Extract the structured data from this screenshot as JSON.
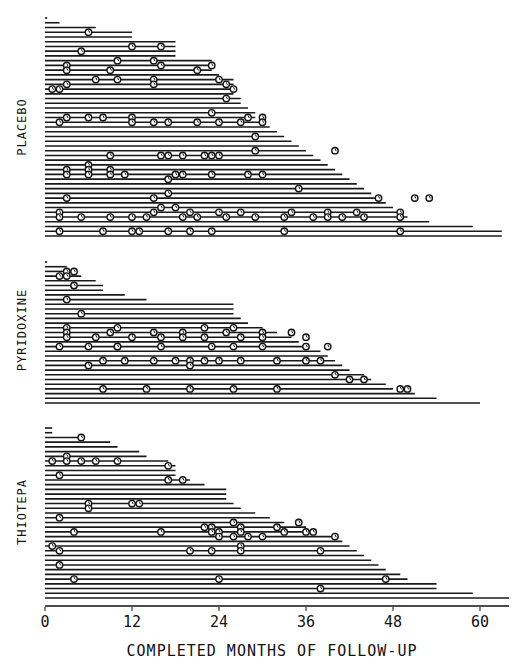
{
  "chart_data": {
    "type": "line",
    "subtype": "patient follow-up timeline (swimmer plot) with recurrence markers",
    "title": "",
    "xlabel": "COMPLETED MONTHS OF FOLLOW-UP",
    "ylabel": "",
    "xlim": [
      0,
      64
    ],
    "x_ticks": [
      0,
      12,
      24,
      36,
      48,
      60
    ],
    "x_tick_labels": [
      "0",
      "12",
      "24",
      "36",
      "48",
      "60"
    ],
    "grid": false,
    "legend": null,
    "marker_meaning": "circled symbol = tumour recurrence at that month",
    "groups": [
      {
        "name": "PLACEBO",
        "patients": [
          {
            "followup": 0.3,
            "recurrences": []
          },
          {
            "followup": 2,
            "recurrences": []
          },
          {
            "followup": 7,
            "recurrences": []
          },
          {
            "followup": 12,
            "recurrences": [
              6
            ]
          },
          {
            "followup": 12,
            "recurrences": []
          },
          {
            "followup": 18,
            "recurrences": []
          },
          {
            "followup": 18,
            "recurrences": [
              12,
              16
            ]
          },
          {
            "followup": 18,
            "recurrences": [
              5
            ]
          },
          {
            "followup": 18,
            "recurrences": []
          },
          {
            "followup": 23,
            "recurrences": [
              10,
              15
            ]
          },
          {
            "followup": 23,
            "recurrences": [
              3,
              16,
              23
            ]
          },
          {
            "followup": 23,
            "recurrences": [
              3,
              9,
              21
            ]
          },
          {
            "followup": 24,
            "recurrences": []
          },
          {
            "followup": 26,
            "recurrences": [
              7,
              10,
              15,
              24
            ]
          },
          {
            "followup": 26,
            "recurrences": [
              3,
              15,
              25
            ]
          },
          {
            "followup": 26,
            "recurrences": [
              1,
              2,
              26
            ]
          },
          {
            "followup": 26,
            "recurrences": []
          },
          {
            "followup": 27,
            "recurrences": [
              25
            ]
          },
          {
            "followup": 27,
            "recurrences": []
          },
          {
            "followup": 28,
            "recurrences": []
          },
          {
            "followup": 29,
            "recurrences": [
              23
            ]
          },
          {
            "followup": 29,
            "recurrences": [
              3,
              6,
              8,
              12,
              28,
              30
            ]
          },
          {
            "followup": 30,
            "recurrences": [
              2,
              12,
              15,
              17,
              21,
              24,
              27,
              30
            ]
          },
          {
            "followup": 31,
            "recurrences": []
          },
          {
            "followup": 32,
            "recurrences": []
          },
          {
            "followup": 33,
            "recurrences": [
              29
            ]
          },
          {
            "followup": 34,
            "recurrences": []
          },
          {
            "followup": 35,
            "recurrences": []
          },
          {
            "followup": 36,
            "recurrences": [
              29,
              40
            ]
          },
          {
            "followup": 37,
            "recurrences": [
              9,
              16,
              17,
              19,
              22,
              23,
              24
            ]
          },
          {
            "followup": 38,
            "recurrences": []
          },
          {
            "followup": 39,
            "recurrences": [
              6
            ]
          },
          {
            "followup": 40,
            "recurrences": [
              3,
              6,
              9
            ]
          },
          {
            "followup": 41,
            "recurrences": [
              3,
              6,
              9,
              11,
              18,
              19,
              23,
              28,
              30
            ]
          },
          {
            "followup": 42,
            "recurrences": [
              17
            ]
          },
          {
            "followup": 43,
            "recurrences": []
          },
          {
            "followup": 44,
            "recurrences": [
              35
            ]
          },
          {
            "followup": 45,
            "recurrences": [
              17
            ]
          },
          {
            "followup": 46,
            "recurrences": [
              3,
              15,
              46,
              51,
              53
            ]
          },
          {
            "followup": 47,
            "recurrences": []
          },
          {
            "followup": 48,
            "recurrences": [
              16,
              18
            ]
          },
          {
            "followup": 49,
            "recurrences": [
              2,
              15,
              20,
              24,
              27,
              34,
              39,
              43,
              49
            ]
          },
          {
            "followup": 50,
            "recurrences": [
              2,
              5,
              9,
              12,
              14,
              19,
              21,
              25,
              29,
              33,
              37,
              39,
              41,
              44,
              49
            ]
          },
          {
            "followup": 53,
            "recurrences": []
          },
          {
            "followup": 59,
            "recurrences": []
          },
          {
            "followup": 63,
            "recurrences": [
              2,
              8,
              12,
              13,
              17,
              20,
              23,
              33,
              49
            ]
          },
          {
            "followup": 63,
            "recurrences": []
          }
        ]
      },
      {
        "name": "PYRIDOXINE",
        "patients": [
          {
            "followup": 0.3,
            "recurrences": []
          },
          {
            "followup": 3,
            "recurrences": []
          },
          {
            "followup": 4,
            "recurrences": [
              3,
              4
            ]
          },
          {
            "followup": 5,
            "recurrences": [
              2,
              3
            ]
          },
          {
            "followup": 7,
            "recurrences": []
          },
          {
            "followup": 8,
            "recurrences": [
              4
            ]
          },
          {
            "followup": 8,
            "recurrences": []
          },
          {
            "followup": 11,
            "recurrences": []
          },
          {
            "followup": 14,
            "recurrences": [
              3
            ]
          },
          {
            "followup": 26,
            "recurrences": []
          },
          {
            "followup": 26,
            "recurrences": []
          },
          {
            "followup": 26,
            "recurrences": [
              5
            ]
          },
          {
            "followup": 27,
            "recurrences": []
          },
          {
            "followup": 28,
            "recurrences": []
          },
          {
            "followup": 30,
            "recurrences": [
              3,
              10,
              22,
              26
            ]
          },
          {
            "followup": 32,
            "recurrences": [
              3,
              9,
              15,
              19,
              25,
              30,
              34
            ]
          },
          {
            "followup": 34,
            "recurrences": [
              3,
              7,
              12,
              16,
              19,
              22,
              27,
              30,
              36
            ]
          },
          {
            "followup": 35,
            "recurrences": []
          },
          {
            "followup": 36,
            "recurrences": [
              2,
              6,
              10,
              10,
              16,
              23,
              26,
              30,
              36,
              39
            ]
          },
          {
            "followup": 38,
            "recurrences": []
          },
          {
            "followup": 39,
            "recurrences": []
          },
          {
            "followup": 40,
            "recurrences": [
              8,
              11,
              15,
              18,
              20,
              22,
              24,
              27,
              32,
              36,
              38
            ]
          },
          {
            "followup": 41,
            "recurrences": [
              6,
              20
            ]
          },
          {
            "followup": 42,
            "recurrences": []
          },
          {
            "followup": 44,
            "recurrences": [
              40
            ]
          },
          {
            "followup": 45,
            "recurrences": [
              42,
              44
            ]
          },
          {
            "followup": 47,
            "recurrences": []
          },
          {
            "followup": 48,
            "recurrences": [
              8,
              14,
              20,
              26,
              32,
              49,
              50
            ]
          },
          {
            "followup": 51,
            "recurrences": []
          },
          {
            "followup": 54,
            "recurrences": []
          },
          {
            "followup": 60,
            "recurrences": []
          }
        ]
      },
      {
        "name": "THIOTEPA",
        "patients": [
          {
            "followup": 1,
            "recurrences": []
          },
          {
            "followup": 1,
            "recurrences": []
          },
          {
            "followup": 5,
            "recurrences": [
              5
            ]
          },
          {
            "followup": 9,
            "recurrences": []
          },
          {
            "followup": 10,
            "recurrences": []
          },
          {
            "followup": 13,
            "recurrences": []
          },
          {
            "followup": 14,
            "recurrences": [
              3
            ]
          },
          {
            "followup": 17,
            "recurrences": [
              1,
              3,
              5,
              7,
              10
            ]
          },
          {
            "followup": 18,
            "recurrences": [
              17
            ]
          },
          {
            "followup": 18,
            "recurrences": []
          },
          {
            "followup": 18,
            "recurrences": [
              2
            ]
          },
          {
            "followup": 20,
            "recurrences": [
              17,
              19
            ]
          },
          {
            "followup": 22,
            "recurrences": []
          },
          {
            "followup": 25,
            "recurrences": []
          },
          {
            "followup": 25,
            "recurrences": []
          },
          {
            "followup": 25,
            "recurrences": []
          },
          {
            "followup": 26,
            "recurrences": [
              6,
              12,
              13
            ]
          },
          {
            "followup": 27,
            "recurrences": [
              6
            ]
          },
          {
            "followup": 29,
            "recurrences": []
          },
          {
            "followup": 31,
            "recurrences": [
              2
            ]
          },
          {
            "followup": 33,
            "recurrences": [
              26,
              35
            ]
          },
          {
            "followup": 36,
            "recurrences": [
              22,
              23,
              27,
              32
            ]
          },
          {
            "followup": 36,
            "recurrences": [
              4,
              16,
              23,
              24,
              27,
              33,
              36,
              37
            ]
          },
          {
            "followup": 40,
            "recurrences": [
              24,
              26,
              28,
              30,
              40
            ]
          },
          {
            "followup": 41,
            "recurrences": []
          },
          {
            "followup": 42,
            "recurrences": [
              1,
              27
            ]
          },
          {
            "followup": 43,
            "recurrences": [
              2,
              20,
              23,
              27,
              38
            ]
          },
          {
            "followup": 44,
            "recurrences": []
          },
          {
            "followup": 45,
            "recurrences": []
          },
          {
            "followup": 46,
            "recurrences": [
              2
            ]
          },
          {
            "followup": 47,
            "recurrences": []
          },
          {
            "followup": 49,
            "recurrences": []
          },
          {
            "followup": 50,
            "recurrences": [
              4,
              24,
              47
            ]
          },
          {
            "followup": 54,
            "recurrences": []
          },
          {
            "followup": 54,
            "recurrences": [
              38
            ]
          },
          {
            "followup": 59,
            "recurrences": []
          },
          {
            "followup": 64,
            "recurrences": []
          }
        ]
      }
    ]
  },
  "layout": {
    "origin_x": 45,
    "px_per_month": 7.25,
    "groups": [
      {
        "top": 18,
        "bottom": 236,
        "label_y": 127
      },
      {
        "top": 262,
        "bottom": 403,
        "label_y": 330
      },
      {
        "top": 428,
        "bottom": 598,
        "label_y": 512
      }
    ],
    "axis_y": 606
  }
}
